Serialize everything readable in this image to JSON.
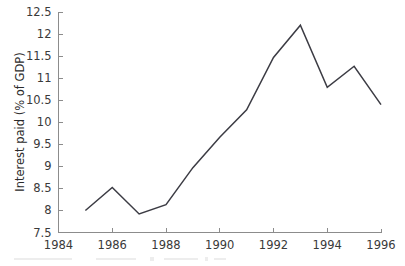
{
  "chart_data": {
    "type": "line",
    "title": "",
    "xlabel": "",
    "ylabel": "Interest paid (% of GDP)",
    "x": [
      1985,
      1986,
      1987,
      1988,
      1989,
      1990,
      1991,
      1992,
      1993,
      1994,
      1995,
      1996
    ],
    "values": [
      8.0,
      8.52,
      7.92,
      8.13,
      8.97,
      9.66,
      10.28,
      11.47,
      12.2,
      10.79,
      11.27,
      10.4
    ],
    "series": [
      {
        "name": "Interest paid (% of GDP)",
        "values": [
          8.0,
          8.52,
          7.92,
          8.13,
          8.97,
          9.66,
          10.28,
          11.47,
          12.2,
          10.79,
          11.27,
          10.4
        ]
      }
    ],
    "xlim": [
      1984,
      1996
    ],
    "ylim": [
      7.5,
      12.5
    ],
    "x_ticks": [
      1984,
      1986,
      1988,
      1990,
      1992,
      1994,
      1996
    ],
    "x_tick_labels": [
      "1984",
      "1986",
      "1988",
      "1990",
      "1992",
      "1994",
      "1996"
    ],
    "y_ticks": [
      7.5,
      8,
      8.5,
      9,
      9.5,
      10,
      10.5,
      11,
      11.5,
      12,
      12.5
    ],
    "y_tick_labels": [
      "7.5",
      "8",
      "8.5",
      "9",
      "9.5",
      "10",
      "10.5",
      "11",
      "11.5",
      "12",
      "12.5"
    ],
    "grid": false,
    "legend": false,
    "legend_position": "none",
    "line_color": "#3c3c44",
    "axis_color": "#8c8c8c",
    "background_color": "#ffffff"
  },
  "axes": {
    "y_title": "Interest paid (% of GDP)"
  }
}
